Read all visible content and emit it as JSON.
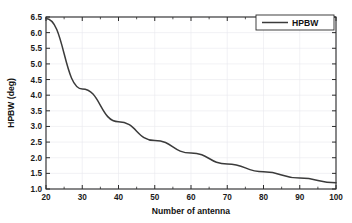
{
  "chart_data": {
    "type": "line",
    "title": "",
    "xlabel": "Number of antenna",
    "ylabel": "HPBW (deg)",
    "xlim": [
      20,
      100
    ],
    "ylim": [
      1.0,
      6.5
    ],
    "grid": true,
    "legend_position": "top-right",
    "x_ticks": [
      20,
      30,
      40,
      50,
      60,
      70,
      80,
      90,
      100
    ],
    "x_tick_labels": [
      "20",
      "30",
      "40",
      "50",
      "60",
      "70",
      "80",
      "90",
      "100"
    ],
    "x_minor_ticks": [
      25,
      35,
      45,
      55,
      65,
      75,
      85,
      95
    ],
    "y_ticks": [
      1.0,
      1.5,
      2.0,
      2.5,
      3.0,
      3.5,
      4.0,
      4.5,
      5.0,
      5.5,
      6.0,
      6.5
    ],
    "y_tick_labels": [
      "1.0",
      "1.5",
      "2.0",
      "2.5",
      "3.0",
      "3.5",
      "4.0",
      "4.5",
      "5.0",
      "5.5",
      "6.0",
      "6.5"
    ],
    "x": [
      20,
      30,
      40,
      50,
      60,
      70,
      80,
      90,
      100
    ],
    "series": [
      {
        "name": "HPBW",
        "color": "#3b3b3b",
        "values": [
          6.45,
          4.2,
          3.15,
          2.55,
          2.15,
          1.8,
          1.55,
          1.35,
          1.2
        ]
      }
    ],
    "legend": [
      {
        "label": "HPBW",
        "color": "#3b3b3b"
      }
    ]
  },
  "legend": {
    "hpbw_label": "HPBW"
  },
  "axes": {
    "x_title": "Number of antenna",
    "y_title": "HPBW (deg)"
  }
}
